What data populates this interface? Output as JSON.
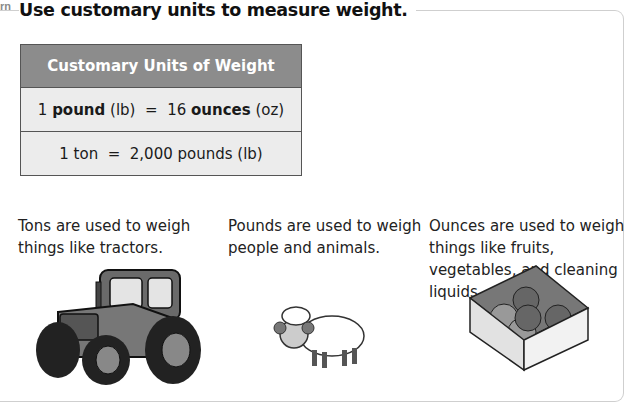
{
  "learn_tag": "rn",
  "heading": "Use customary units to measure weight.",
  "table": {
    "title": "Customary Units of Weight",
    "rows": [
      {
        "qty1": "1",
        "unit1": "pound",
        "abbr1": "(lb)",
        "eq": "=",
        "qty2": "16",
        "unit2": "ounces",
        "abbr2": "(oz)"
      },
      {
        "text": "1 ton  =  2,000 pounds (lb)"
      }
    ]
  },
  "columns": [
    {
      "text": "Tons are used to weigh things like tractors.",
      "image": "tractor-illustration"
    },
    {
      "text": "Pounds are used to weigh people and animals.",
      "image": "sheep-illustration"
    },
    {
      "text": "Ounces are used to weigh things like fruits, vegetables, and cleaning liquids.",
      "image": "fruit-box-illustration"
    }
  ],
  "colors": {
    "header_bg": "#8c8c8c",
    "row_bg": "#ececec",
    "frame": "#cfcfcf"
  }
}
